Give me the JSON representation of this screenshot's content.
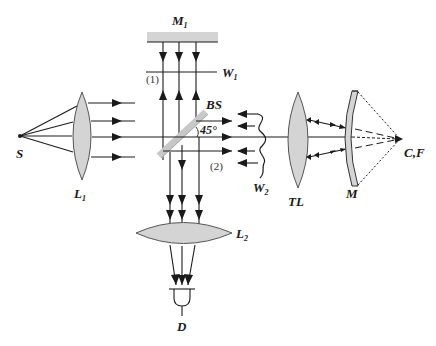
{
  "diagram": {
    "colors": {
      "line": "#1a1a1a",
      "optic_fill": "#d4d4d4",
      "optic_stroke": "#555555",
      "background": "#ffffff"
    },
    "labels": {
      "source": "S",
      "lens1": "L",
      "lens1_sub": "1",
      "mirror1": "M",
      "mirror1_sub": "1",
      "wavefront1": "W",
      "wavefront1_sub": "1",
      "arm1": "(1)",
      "beamsplitter": "BS",
      "angle": "45°",
      "arm2": "(2)",
      "wavefront2": "W",
      "wavefront2_sub": "2",
      "tube_lens": "TL",
      "mirror": "M",
      "focus": "C,F",
      "lens2": "L",
      "lens2_sub": "2",
      "detector": "D"
    },
    "components": [
      {
        "id": "S",
        "type": "point-source"
      },
      {
        "id": "L1",
        "type": "collimating-lens"
      },
      {
        "id": "BS",
        "type": "beam-splitter",
        "angle_deg": 45
      },
      {
        "id": "M1",
        "type": "reference-mirror"
      },
      {
        "id": "W1",
        "type": "plane-wavefront"
      },
      {
        "id": "W2",
        "type": "distorted-wavefront"
      },
      {
        "id": "TL",
        "type": "lens"
      },
      {
        "id": "M",
        "type": "spherical-mirror-under-test"
      },
      {
        "id": "C,F",
        "type": "center-of-curvature-focus"
      },
      {
        "id": "L2",
        "type": "imaging-lens"
      },
      {
        "id": "D",
        "type": "detector"
      }
    ]
  }
}
